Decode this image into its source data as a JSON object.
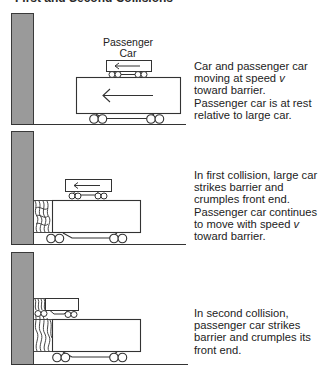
{
  "figure": {
    "title": "First and Second Collisions",
    "colors": {
      "barrier_fill": "#9a9a9a",
      "barrier_stroke": "#3a3a3a",
      "line": "#333333",
      "background": "#ffffff"
    },
    "panels": [
      {
        "id": "panel-1",
        "label_top": "Passenger",
        "label_bottom": "Car",
        "caption_parts": {
          "a": "Car and passenger car moving at speed ",
          "v": "v",
          "b": " toward barrier. Passenger car is at rest relative to large car."
        }
      },
      {
        "id": "panel-2",
        "caption_parts": {
          "a": "In first collision, large car strikes barrier and crumples front end. Passenger car continues to move with speed ",
          "v": "v",
          "b": " toward barrier."
        }
      },
      {
        "id": "panel-3",
        "caption_parts": {
          "a": "In second collision, passenger car strikes barrier and crumples its front end."
        }
      }
    ]
  }
}
